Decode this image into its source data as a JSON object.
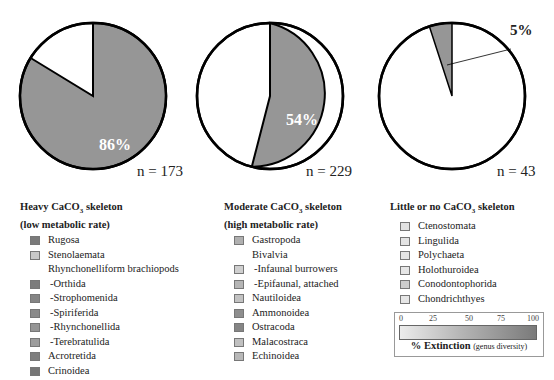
{
  "chart_data": [
    {
      "type": "pie",
      "title": "Heavy CaCO3 skeleton (low metabolic rate)",
      "n_label": "n = 173",
      "n": 173,
      "slices": [
        {
          "label": "Extinct",
          "value": 86
        },
        {
          "label": "Survived",
          "value": 14
        }
      ],
      "pct_label": "86%",
      "fill_color": "#969696"
    },
    {
      "type": "pie",
      "title": "Moderate CaCO3 skeleton (high metabolic rate)",
      "n_label": "n = 229",
      "n": 229,
      "slices": [
        {
          "label": "Extinct",
          "value": 54
        },
        {
          "label": "Survived",
          "value": 46
        }
      ],
      "pct_label": "54%",
      "fill_color": "#969696"
    },
    {
      "type": "pie",
      "title": "Little or no CaCO3 skeleton",
      "n_label": "n = 43",
      "n": 43,
      "slices": [
        {
          "label": "Extinct",
          "value": 5
        },
        {
          "label": "Survived",
          "value": 95
        }
      ],
      "pct_label": "5%",
      "fill_color": "#969696"
    }
  ],
  "legend": {
    "heavy": {
      "title_line1_pre": "Heavy CaCO",
      "title_sub": "3",
      "title_line1_post": " skeleton",
      "title_line2": "(low metabolic rate)",
      "items": [
        {
          "label": "Rugosa",
          "color": "#7a7a7a"
        },
        {
          "label": "Stenolaemata",
          "color": "#c8c8c8"
        },
        {
          "label": "Rhynchonelliform brachiopods",
          "color": null
        },
        {
          "label": "-Orthida",
          "color": "#7c7c7c",
          "sub": true
        },
        {
          "label": "-Strophomenida",
          "color": "#848484",
          "sub": true
        },
        {
          "label": "-Spiriferida",
          "color": "#8a8a8a",
          "sub": true
        },
        {
          "label": "-Rhynchonellida",
          "color": "#959595",
          "sub": true
        },
        {
          "label": "-Terebratulida",
          "color": "#9c9c9c",
          "sub": true
        },
        {
          "label": "Acrotretida",
          "color": "#7e7e7e"
        },
        {
          "label": "Crinoidea",
          "color": "#767676"
        }
      ]
    },
    "moderate": {
      "title_line1_pre": "Moderate CaCO",
      "title_sub": "3",
      "title_line1_post": " skeleton",
      "title_line2": "(high metabolic rate)",
      "items": [
        {
          "label": "Gastropoda",
          "color": "#b0b0b0"
        },
        {
          "label": "Bivalvia",
          "color": null
        },
        {
          "label": "-Infaunal burrowers",
          "color": "#cfcfcf",
          "sub": true
        },
        {
          "label": "-Epifaunal, attached",
          "color": "#b5b5b5",
          "sub": true
        },
        {
          "label": "Nautiloidea",
          "color": "#c2c2c2"
        },
        {
          "label": "Ammonoidea",
          "color": "#8e8e8e"
        },
        {
          "label": "Ostracoda",
          "color": "#858585"
        },
        {
          "label": "Malacostraca",
          "color": "#c0c0c0"
        },
        {
          "label": "Echinoidea",
          "color": "#b8b8b8"
        }
      ]
    },
    "little": {
      "title_line1_pre": "Little or no CaCO",
      "title_sub": "3",
      "title_line1_post": " skeleton",
      "items": [
        {
          "label": "Ctenostomata",
          "color": "#e2e2e2"
        },
        {
          "label": "Lingulida",
          "color": "#e4e4e4"
        },
        {
          "label": "Polychaeta",
          "color": "#e4e4e4"
        },
        {
          "label": "Holothuroidea",
          "color": "#e6e6e6"
        },
        {
          "label": "Conodontophorida",
          "color": "#cdcdcd"
        },
        {
          "label": "Chondrichthyes",
          "color": "#e6e6e6"
        }
      ]
    }
  },
  "scale": {
    "ticks": [
      "0",
      "25",
      "50",
      "75",
      "100"
    ],
    "title_bold": "% Extinction",
    "title_sub": "(genus diversity)"
  }
}
